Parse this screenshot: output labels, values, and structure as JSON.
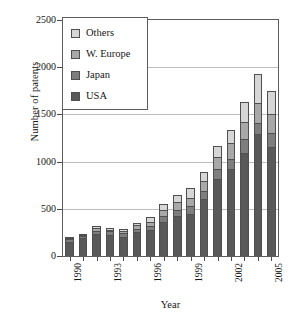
{
  "chart_data": {
    "type": "bar",
    "subtype": "stacked-bar",
    "title": "",
    "xlabel": "Year",
    "ylabel": "Number of patents",
    "categories": [
      "1990",
      "1991",
      "1992",
      "1993",
      "1994",
      "1995",
      "1996",
      "1997",
      "1998",
      "1999",
      "2000",
      "2001",
      "2002",
      "2003",
      "2004",
      "2005"
    ],
    "tick_labels_shown": [
      "1990",
      "1993",
      "1996",
      "1999",
      "2002",
      "2005"
    ],
    "ylim": [
      0,
      2500
    ],
    "yticks": [
      0,
      500,
      1000,
      1500,
      2000,
      2500
    ],
    "grid": true,
    "legend_position": "top-left",
    "series": [
      {
        "name": "USA",
        "color": "#595959",
        "values": [
          150,
          190,
          235,
          225,
          200,
          255,
          280,
          360,
          425,
          440,
          605,
          815,
          920,
          1090,
          1295,
          1150
        ]
      },
      {
        "name": "Japan",
        "color": "#7e7e7e",
        "values": [
          30,
          20,
          35,
          35,
          40,
          30,
          35,
          60,
          65,
          85,
          85,
          110,
          110,
          150,
          115,
          150
        ]
      },
      {
        "name": "W. Europe",
        "color": "#a8a8a8",
        "values": [
          15,
          15,
          25,
          20,
          25,
          45,
          45,
          65,
          85,
          95,
          110,
          120,
          165,
          185,
          210,
          200
        ]
      },
      {
        "name": "Others",
        "color": "#d6d6d6",
        "values": [
          10,
          10,
          20,
          15,
          25,
          25,
          50,
          70,
          75,
          100,
          85,
          120,
          145,
          205,
          310,
          245
        ]
      }
    ],
    "totals": [
      205,
      235,
      315,
      295,
      290,
      355,
      410,
      555,
      650,
      720,
      885,
      1165,
      1340,
      1630,
      1930,
      1745
    ]
  },
  "legend": {
    "items": [
      {
        "label": "Others",
        "key": "others"
      },
      {
        "label": "W. Europe",
        "key": "weuro"
      },
      {
        "label": "Japan",
        "key": "japan"
      },
      {
        "label": "USA",
        "key": "usa"
      }
    ]
  },
  "axes": {
    "y_title": "Number of patents",
    "x_title": "Year"
  }
}
